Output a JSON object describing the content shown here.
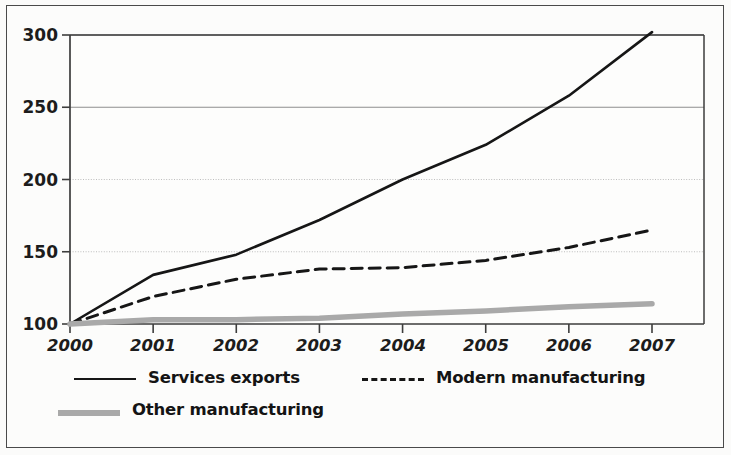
{
  "figure": {
    "background_color": "#fcfcfb",
    "frame_color": "#4a4a4a"
  },
  "axes": {
    "y_ticks": [
      "100",
      "150",
      "200",
      "250",
      "300"
    ],
    "x_ticks": [
      "2000",
      "2001",
      "2002",
      "2003",
      "2004",
      "2005",
      "2006",
      "2007"
    ]
  },
  "legend": {
    "items": [
      {
        "label": "Services exports",
        "style": "solid",
        "color": "#161616",
        "swatch": "solid-line-swatch"
      },
      {
        "label": "Modern manufacturing",
        "style": "dashed",
        "color": "#161616",
        "swatch": "dashed-line-swatch"
      },
      {
        "label": "Other manufacturing",
        "style": "thick-gray",
        "color": "#a9a9a9",
        "swatch": "thick-gray-line-swatch"
      }
    ]
  },
  "chart_data": {
    "type": "line",
    "title": "",
    "subtitle": "",
    "xlabel": "",
    "ylabel": "",
    "x": [
      2000,
      2001,
      2002,
      2003,
      2004,
      2005,
      2006,
      2007
    ],
    "xtick_labels": [
      "2000",
      "2001",
      "2002",
      "2003",
      "2004",
      "2005",
      "2006",
      "2007"
    ],
    "ytick_labels": [
      "100",
      "150",
      "200",
      "250",
      "300"
    ],
    "yticks": [
      100,
      150,
      200,
      250,
      300
    ],
    "xlim": [
      2000,
      2007
    ],
    "ylim": [
      100,
      300
    ],
    "grid": "horizontal",
    "legend_position": "below-axes-left",
    "series": [
      {
        "name": "Services exports",
        "style": "solid",
        "color": "#161616",
        "width": 2.6,
        "values": [
          100,
          134,
          148,
          172,
          200,
          224,
          258,
          302
        ]
      },
      {
        "name": "Modern manufacturing",
        "style": "dashed",
        "color": "#161616",
        "width": 3.0,
        "values": [
          100,
          119,
          131,
          138,
          139,
          144,
          153,
          165
        ]
      },
      {
        "name": "Other manufacturing",
        "style": "solid",
        "color": "#a9a9a9",
        "width": 5.5,
        "values": [
          100,
          103,
          103,
          104,
          107,
          109,
          112,
          114
        ]
      }
    ]
  }
}
